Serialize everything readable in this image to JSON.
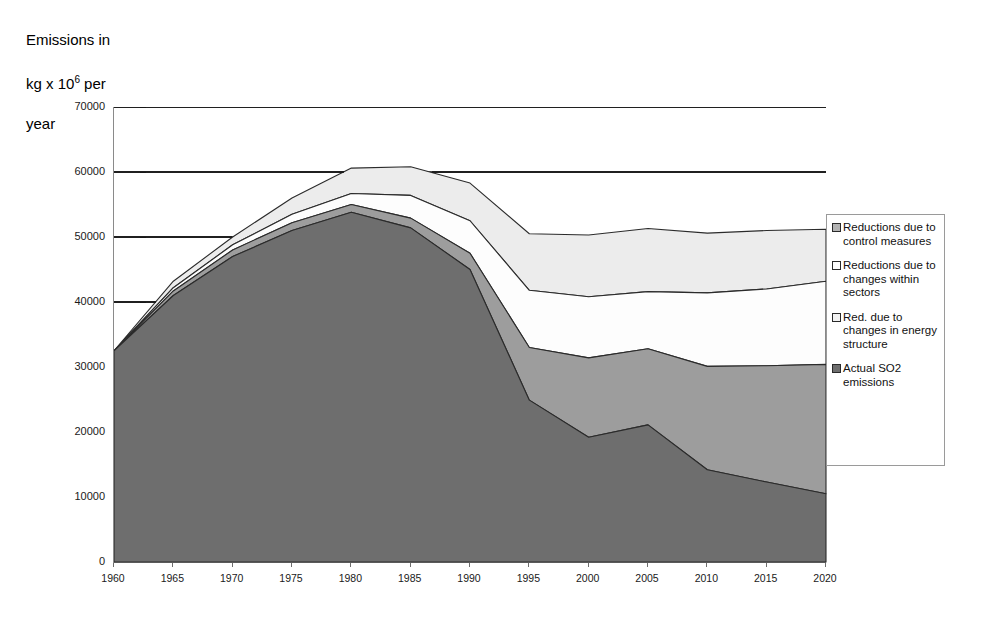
{
  "axis_title": {
    "line1": "Emissions in",
    "line2_pre": "kg x 10",
    "line2_sup": "6",
    "line2_post": " per",
    "line3": "year"
  },
  "legend": {
    "items": [
      {
        "label": "Reductions due to control measures",
        "color": "#b3b3b3",
        "name": "reductions-control-measures"
      },
      {
        "label": "Reductions due to changes within sectors",
        "color": "#fdfdfd",
        "name": "reductions-changes-within-sectors"
      },
      {
        "label": "Red. due to changes in energy structure",
        "color": "#f2f2f2",
        "name": "red-changes-energy-structure"
      },
      {
        "label": "Actual SO2 emissions",
        "color": "#6e6e6e",
        "name": "actual-so2-emissions"
      }
    ]
  },
  "chart_data": {
    "type": "area",
    "stacked": true,
    "title": "",
    "xlabel": "",
    "ylabel": "Emissions in kg x 10^6 per year",
    "ylim": [
      0,
      70000
    ],
    "xlim": [
      1960,
      2020
    ],
    "grid": true,
    "gridlines_y": [
      40000,
      50000,
      60000,
      70000
    ],
    "legend_position": "right",
    "categories": [
      1960,
      1965,
      1970,
      1975,
      1980,
      1985,
      1990,
      1995,
      2000,
      2005,
      2010,
      2015,
      2020
    ],
    "ytick_labels": [
      "0",
      "10000",
      "20000",
      "30000",
      "40000",
      "50000",
      "60000",
      "70000"
    ],
    "ytick_values": [
      0,
      10000,
      20000,
      30000,
      40000,
      50000,
      60000,
      70000
    ],
    "xtick_labels": [
      "1960",
      "1965",
      "1970",
      "1975",
      "1980",
      "1985",
      "1990",
      "1995",
      "2000",
      "2005",
      "2010",
      "2015",
      "2020"
    ],
    "series": [
      {
        "name": "Actual SO2 emissions",
        "color": "#6e6e6e",
        "stack_order": 1,
        "values": [
          32500,
          41000,
          47000,
          51000,
          53800,
          51400,
          45000,
          24900,
          19200,
          21100,
          14200,
          12300,
          10500
        ]
      },
      {
        "name": "Red. due to changes in energy structure",
        "color": "#9d9d9d",
        "stack_order": 2,
        "values": [
          0,
          700,
          1000,
          1200,
          1200,
          1500,
          2500,
          8100,
          12200,
          11700,
          15900,
          17900,
          19900
        ]
      },
      {
        "name": "Reductions due to changes within sectors",
        "color": "#fdfdfd",
        "stack_order": 3,
        "values": [
          0,
          500,
          800,
          1300,
          1700,
          3500,
          5000,
          8800,
          9400,
          8800,
          11300,
          11800,
          12800
        ]
      },
      {
        "name": "Reductions due to control measures",
        "color": "#ececec",
        "stack_order": 4,
        "values": [
          0,
          1000,
          1200,
          2500,
          3900,
          4400,
          5800,
          8700,
          9500,
          9700,
          9200,
          9000,
          8000
        ]
      }
    ],
    "cumulative_tops": {
      "actual_so2_emissions": [
        32500,
        41000,
        47000,
        51000,
        53800,
        51400,
        45000,
        24900,
        19200,
        21100,
        14200,
        12300,
        10500
      ],
      "plus_energy_structure": [
        32500,
        41700,
        48000,
        52200,
        55000,
        52900,
        47500,
        33000,
        31400,
        32800,
        30100,
        30200,
        30400
      ],
      "plus_within_sectors": [
        32500,
        42200,
        48800,
        53500,
        56700,
        56400,
        52500,
        41800,
        40800,
        41600,
        41400,
        42000,
        43200
      ],
      "plus_control_measures": [
        32500,
        43200,
        50000,
        56000,
        60600,
        60800,
        58300,
        50500,
        50300,
        51300,
        50600,
        51000,
        51200
      ]
    }
  }
}
